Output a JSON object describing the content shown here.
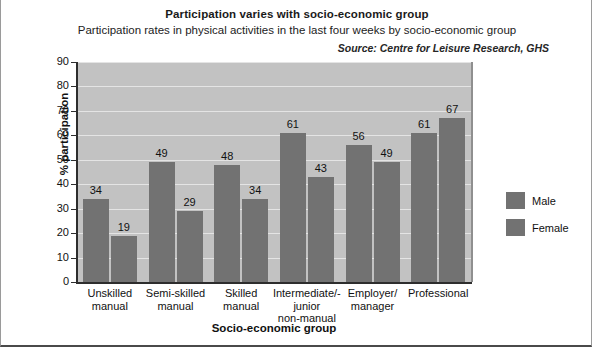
{
  "chart_data": {
    "type": "bar",
    "title": "Participation varies with socio-economic group",
    "subtitle": "Participation rates in physical activities in the last four weeks by socio-economic group",
    "source": "Source: Centre for Leisure Research, GHS",
    "xlabel": "Socio-economic group",
    "ylabel": "% participation",
    "ylim": [
      0,
      90
    ],
    "yticks": [
      0,
      10,
      20,
      30,
      40,
      50,
      60,
      70,
      80,
      90
    ],
    "grid": true,
    "legend_position": "right",
    "categories": [
      "Unskilled\nmanual",
      "Semi-skilled\nmanual",
      "Skilled\nmanual",
      "Intermediate/-\njunior\nnon-manual",
      "Employer/\nmanager",
      "Professional"
    ],
    "series": [
      {
        "name": "Male",
        "color": "#727272",
        "values": [
          34,
          49,
          48,
          61,
          56,
          61
        ]
      },
      {
        "name": "Female",
        "color": "#727272",
        "values": [
          19,
          29,
          34,
          43,
          49,
          67
        ]
      }
    ]
  },
  "colors": {
    "bar": "#727272",
    "plot_background": "#c2c2c2",
    "gridline": "#e4e4e4",
    "axis": "#2d2d2d",
    "page_background": "#ffffff"
  }
}
